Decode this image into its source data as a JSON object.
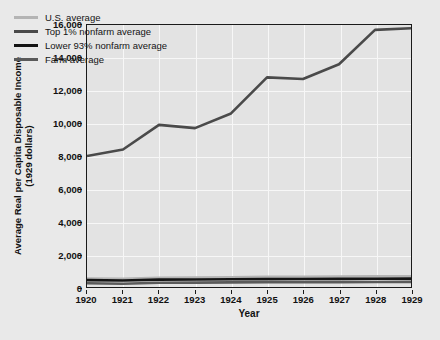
{
  "chart_data": {
    "type": "line",
    "title": "",
    "xlabel": "Year",
    "ylabel": "Average Real per Capita Disposable Income (1929 dollars)",
    "ylabel_line1": "Average Real per Capita Disposable Income",
    "ylabel_line2": "(1929 dollars)",
    "categories": [
      "1920",
      "1921",
      "1922",
      "1923",
      "1924",
      "1925",
      "1926",
      "1927",
      "1928",
      "1929"
    ],
    "x": [
      1920,
      1921,
      1922,
      1923,
      1924,
      1925,
      1926,
      1927,
      1928,
      1929
    ],
    "xlim": [
      1920,
      1929
    ],
    "ylim": [
      0,
      16000
    ],
    "yticks": [
      0,
      2000,
      4000,
      6000,
      8000,
      10000,
      12000,
      14000,
      16000
    ],
    "ytick_labels": [
      "0",
      "2,000",
      "4,000",
      "6,000",
      "8,000",
      "10,000",
      "12,000",
      "14,000",
      "16,000"
    ],
    "grid": true,
    "legend_position": "upper-left",
    "series": [
      {
        "name": "U.S. average",
        "color": "#b4b4b4",
        "values": [
          520,
          500,
          560,
          580,
          600,
          620,
          630,
          640,
          650,
          660
        ]
      },
      {
        "name": "Top 1% nonfarm average",
        "color": "#4a4a4a",
        "values": [
          8000,
          8400,
          9900,
          9700,
          10600,
          12800,
          12700,
          13600,
          15700,
          15800
        ]
      },
      {
        "name": "Lower 93% nonfarm average",
        "color": "#141414",
        "values": [
          420,
          400,
          450,
          460,
          470,
          480,
          490,
          495,
          500,
          510
        ]
      },
      {
        "name": "Farm average",
        "color": "#5a5a5a",
        "values": [
          230,
          200,
          260,
          270,
          280,
          290,
          295,
          300,
          305,
          310
        ]
      }
    ]
  },
  "legend": {
    "items": [
      {
        "label": "U.S. average",
        "color": "#b4b4b4"
      },
      {
        "label": "Top 1% nonfarm average",
        "color": "#4a4a4a"
      },
      {
        "label": "Lower 93% nonfarm average",
        "color": "#141414"
      },
      {
        "label": "Farm average",
        "color": "#5a5a5a"
      }
    ]
  },
  "colors": {
    "figure_background": "#e9e9e9",
    "plot_background": "#e3e3e3",
    "gridline": "#f7f7f7",
    "axis": "#1a1a1a",
    "text": "#111111"
  }
}
